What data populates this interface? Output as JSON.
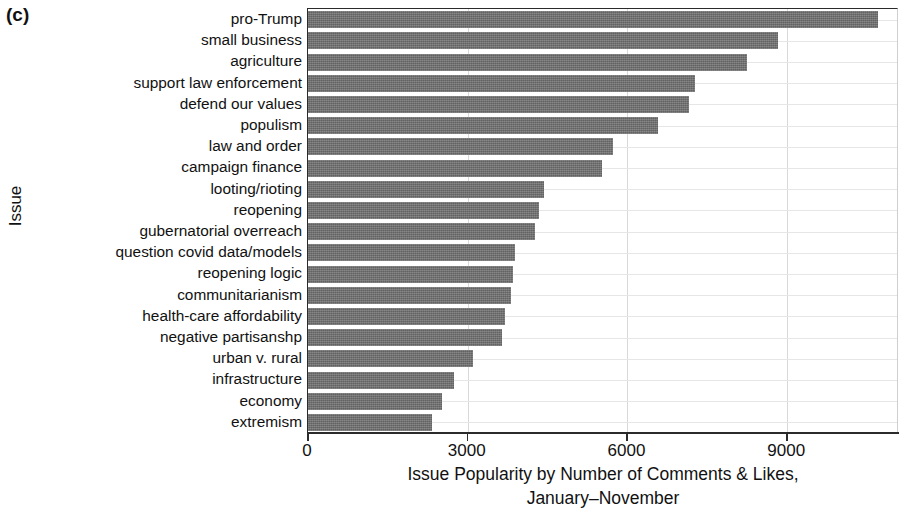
{
  "panel_label": "(c)",
  "axes": {
    "y_title": "Issue",
    "x_title_line1": "Issue Popularity by Number of Comments & Likes,",
    "x_title_line2": "January–November"
  },
  "colors": {
    "bar_fill": "#6f6f6f",
    "axis": "#2b2b2b",
    "gridline": "#d9d9d9",
    "background": "#ffffff",
    "text": "#111111"
  },
  "chart_data": {
    "type": "bar",
    "orientation": "horizontal",
    "title": "",
    "subtitle": "",
    "xlabel": "Issue Popularity by Number of Comments & Likes, January–November",
    "ylabel": "Issue",
    "xlim": [
      0,
      11100
    ],
    "xticks": [
      0,
      3000,
      6000,
      9000
    ],
    "xtick_labels": [
      "0",
      "3000",
      "6000",
      "9000"
    ],
    "grid": true,
    "grid_axis": "both",
    "legend": "none",
    "categories": [
      "pro-Trump",
      "small business",
      "agriculture",
      "support law enforcement",
      "defend our values",
      "populism",
      "law and order",
      "campaign finance",
      "looting/rioting",
      "reopening",
      "gubernatorial overreach",
      "question covid data/models",
      "reopening logic",
      "communitarianism",
      "health-care affordability",
      "negative partisanshp",
      "urban v. rural",
      "infrastructure",
      "economy",
      "extremism"
    ],
    "values": [
      10700,
      8830,
      8250,
      7270,
      7160,
      6580,
      5730,
      5530,
      4440,
      4340,
      4270,
      3890,
      3850,
      3820,
      3700,
      3650,
      3100,
      2740,
      2520,
      2330
    ]
  }
}
